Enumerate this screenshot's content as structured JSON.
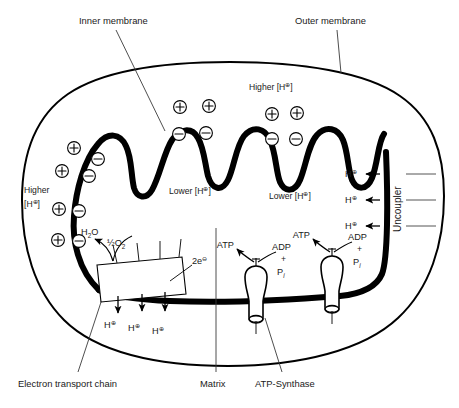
{
  "figure": {
    "background_color": "#ffffff",
    "ink_color": "#000000",
    "leader_color": "#3a3a3a"
  },
  "callouts": {
    "inner_membrane": "Inner membrane",
    "outer_membrane": "Outer membrane",
    "electron_transport_chain": "Electron transport chain",
    "matrix": "Matrix",
    "atp_synthase": "ATP-Synthase"
  },
  "concentration_labels": {
    "higher_top": {
      "prefix": "Higher [H",
      "charge": "⊕",
      "suffix": "]"
    },
    "higher_left_line1": "Higher",
    "higher_left_line2": {
      "prefix": "[H",
      "charge": "⊕",
      "suffix": "]"
    },
    "lower_left": {
      "prefix": "Lower [H",
      "charge": "⊕",
      "suffix": "]"
    },
    "lower_right": {
      "prefix": "Lower [H",
      "charge": "⊕",
      "suffix": "]"
    }
  },
  "molecules": {
    "water": {
      "base": "H",
      "sub": "2",
      "tail": "O"
    },
    "half_oxygen": {
      "frac": "½",
      "base": "O",
      "sub": "2"
    },
    "electrons": {
      "count": "2e",
      "charge": "⊖"
    },
    "atp": "ATP",
    "adp": "ADP",
    "plus": "+",
    "phosphate": {
      "base": "P",
      "sub": "i"
    },
    "proton": {
      "base": "H",
      "charge": "⊕"
    }
  },
  "uncoupler": {
    "label": "Uncoupler",
    "proton_rows": 3,
    "proton": {
      "base": "H",
      "charge": "⊕"
    }
  },
  "pumped_protons": {
    "count": 3,
    "label": {
      "base": "H",
      "charge": "⊕"
    }
  },
  "charges": {
    "positive_symbol": "+",
    "negative_symbol": "−",
    "outer_positive_count": 8,
    "inner_negative_count": 8
  },
  "atp_synthase_units": [
    {
      "id": "synthase-left",
      "atp": "ATP",
      "adp": "ADP",
      "plus": "+",
      "pi_base": "P",
      "pi_sub": "i"
    },
    {
      "id": "synthase-right",
      "atp": "ATP",
      "adp": "ADP",
      "plus": "+",
      "pi_base": "P",
      "pi_sub": "i"
    }
  ]
}
